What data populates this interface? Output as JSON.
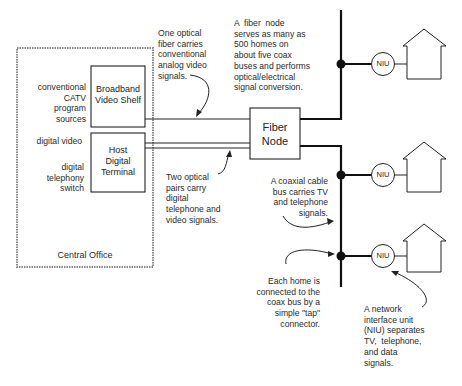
{
  "diagram": {
    "type": "network-architecture",
    "central_office": {
      "label": "Central Office",
      "boxes": [
        {
          "id": "broadband-video-shelf",
          "label": "Broadband\nVideo Shelf"
        },
        {
          "id": "host-digital-terminal",
          "label": "Host\nDigital\nTerminal"
        }
      ],
      "inputs": [
        {
          "label": "conventional\nCATV\nprogram\nsources",
          "to": "broadband-video-shelf"
        },
        {
          "label": "digital video",
          "to": "host-digital-terminal"
        },
        {
          "label": "digital\ntelephony\nswitch",
          "to": "host-digital-terminal"
        }
      ]
    },
    "fiber_node": {
      "label": "Fiber\nNode"
    },
    "niu_label": "NIU",
    "nius": [
      {
        "id": "niu-1",
        "label": "NIU"
      },
      {
        "id": "niu-2",
        "label": "NIU"
      },
      {
        "id": "niu-3",
        "label": "NIU"
      }
    ],
    "annotations": {
      "one_fiber": "One optical\nfiber carries\nconventional\nanalog video\nsignals.",
      "fiber_node": "A  fiber  node\nserves as many as\n500 homes on\nabout five coax\nbuses and performs\noptical/electrical\nsignal conversion.",
      "two_pairs": "Two optical\npairs carry\ndigital\ntelephone and\nvideo signals.",
      "coax_bus": "A coaxial cable\nbus carries TV\nand telephone\nsignals.",
      "tap": "Each home is\nconnected to the\ncoax bus by a\nsimple \"tap\"\nconnector.",
      "niu": "A network\ninterface unit\n(NIU) separates\nTV,  telephone,\nand data\nsignals."
    },
    "connections": [
      {
        "from": "broadband-video-shelf",
        "to": "fiber-node",
        "medium": "optical fiber (1)"
      },
      {
        "from": "host-digital-terminal",
        "to": "fiber-node",
        "medium": "optical pairs (2)"
      },
      {
        "from": "fiber-node",
        "to": "coax-bus-1",
        "medium": "coax"
      },
      {
        "from": "fiber-node",
        "to": "coax-bus-2",
        "medium": "coax"
      },
      {
        "from": "coax-bus-1",
        "to": "niu-1",
        "medium": "tap"
      },
      {
        "from": "coax-bus-2",
        "to": "niu-2",
        "medium": "tap"
      },
      {
        "from": "coax-bus-2",
        "to": "niu-3",
        "medium": "tap"
      }
    ],
    "colors": {
      "line": "#1a1a1a",
      "dashed_border": "#777777",
      "text": "#2a2a2a"
    }
  }
}
